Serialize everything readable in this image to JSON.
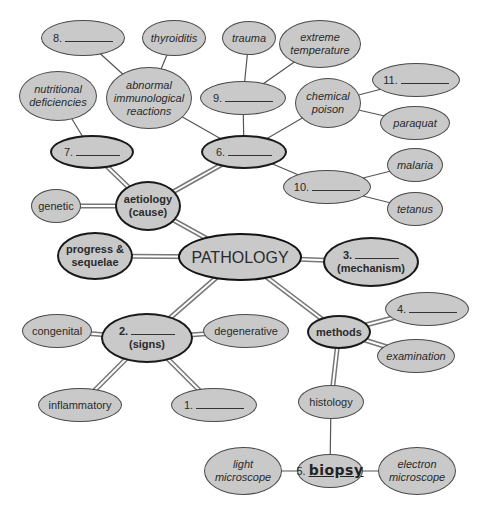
{
  "diagram": {
    "center": {
      "label": "PATHOLOGY"
    },
    "branches": {
      "aetiology": {
        "line1": "aetiology",
        "line2": "(cause)"
      },
      "progress": {
        "line1": "progress &",
        "line2": "sequelae"
      },
      "mechanism": {
        "number": "3.",
        "line2": "(mechanism)"
      },
      "signs": {
        "number": "2.",
        "line2": "(signs)"
      },
      "methods": {
        "label": "methods"
      }
    },
    "aetiology_children": {
      "genetic": {
        "label": "genetic"
      },
      "blank7": {
        "number": "7."
      },
      "blank6": {
        "number": "6."
      }
    },
    "blank7_children": {
      "nutritional": {
        "line1": "nutritional",
        "line2": "deficiencies"
      }
    },
    "blank6_children": {
      "immuno": {
        "line1": "abnormal",
        "line2": "immunological",
        "line3": "reactions"
      },
      "blank9": {
        "number": "9."
      },
      "chemical": {
        "line1": "chemical",
        "line2": "poison"
      },
      "blank10": {
        "number": "10."
      }
    },
    "immuno_children": {
      "blank8": {
        "number": "8."
      },
      "thyroiditis": {
        "label": "thyroiditis"
      }
    },
    "blank9_children": {
      "trauma": {
        "label": "trauma"
      },
      "extreme": {
        "line1": "extreme",
        "line2": "temperature"
      }
    },
    "chemical_children": {
      "blank11": {
        "number": "11."
      },
      "paraquat": {
        "label": "paraquat"
      }
    },
    "blank10_children": {
      "malaria": {
        "label": "malaria"
      },
      "tetanus": {
        "label": "tetanus"
      }
    },
    "signs_children": {
      "congenital": {
        "label": "congenital"
      },
      "degenerative": {
        "label": "degenerative"
      },
      "inflammatory": {
        "label": "inflammatory"
      },
      "blank1": {
        "number": "1."
      }
    },
    "methods_children": {
      "blank4": {
        "number": "4."
      },
      "examination": {
        "label": "examination"
      },
      "histology": {
        "label": "histology"
      }
    },
    "histology_children": {
      "biopsy": {
        "number": "5.",
        "answer": "biopsy"
      },
      "light": {
        "line1": "light",
        "line2": "microscope"
      },
      "electron": {
        "line1": "electron",
        "line2": "microscope"
      }
    },
    "colors": {
      "node_fill": "#c9c9c9",
      "outline": "#1a1a1a",
      "connector": "#6a6a6a"
    }
  }
}
